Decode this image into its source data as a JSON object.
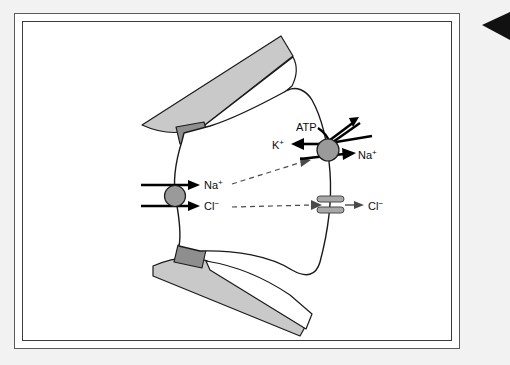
{
  "figure": {
    "background_color": "#f2f2f2",
    "panel_color": "#ffffff",
    "border_color": "#3b3b3b"
  },
  "colors": {
    "cell_fill": "#ffffff",
    "neighbor_cell_fill": "#c9c9c9",
    "tight_junction_fill": "#8e8e8e",
    "transporter_fill": "#9a9a9a",
    "channel_fill": "#a8a8a8",
    "outline": "#1a1a1a",
    "arrow": "#000000",
    "dashed_arrow": "#4a4a4a",
    "corner_marker": "#111111"
  },
  "labels": {
    "atp": "ATP",
    "k_left": "K",
    "k_charge": "+",
    "na_apical": "Na",
    "na_apical_charge": "+",
    "cl_apical": "Cl",
    "cl_apical_charge": "−",
    "na_basolateral": "Na",
    "na_basolateral_charge": "+",
    "cl_basolateral": "Cl",
    "cl_basolateral_charge": "−"
  },
  "elements": {
    "apical_transporter": "Na-Cl cotransporter",
    "basolateral_pump": "Na-K-ATPase pump",
    "chloride_channel": "chloride channel",
    "upper_neighbor_cell": "adjacent epithelial cell (upper)",
    "lower_neighbor_cell": "adjacent epithelial cell (lower)",
    "upper_tight_junction": "tight junction (upper)",
    "lower_tight_junction": "tight junction (lower)",
    "corner_marker": "black triangle pointer"
  }
}
